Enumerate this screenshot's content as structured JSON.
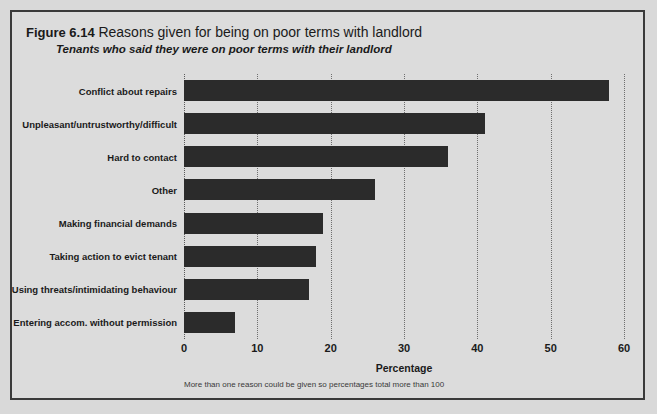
{
  "figure": {
    "number": "Figure 6.14",
    "title": "Reasons given for being on poor terms with landlord",
    "subtitle": "Tenants who said they were on poor terms with their landlord",
    "footnote": "More than one reason could be given so percentages total more than 100"
  },
  "colors": {
    "bar": "#2b2b2b",
    "background": "#dcdcdc",
    "frame_border": "#3a3a3a",
    "gridline": "#6e6e6e",
    "text": "#1a1a1a"
  },
  "chart_data": {
    "type": "bar",
    "orientation": "horizontal",
    "title": "Reasons given for being on poor terms with landlord",
    "subtitle": "Tenants who said they were on poor terms with their landlord",
    "xlabel": "Percentage",
    "ylabel": "",
    "xlim": [
      0,
      60
    ],
    "xticks": [
      0,
      10,
      20,
      30,
      40,
      50,
      60
    ],
    "xtick_labels": [
      "0",
      "10",
      "20",
      "30",
      "40",
      "50",
      "60"
    ],
    "grid": "vertical-dotted",
    "legend": "none",
    "note": "More than one reason could be given so percentages total more than 100",
    "categories": [
      "Conflict about repairs",
      "Unpleasant/untrustworthy/difficult",
      "Hard to contact",
      "Other",
      "Making financial demands",
      "Taking action to evict tenant",
      "Using threats/intimidating behaviour",
      "Entering accom. without permission"
    ],
    "values": [
      58,
      41,
      36,
      26,
      19,
      18,
      17,
      7
    ]
  }
}
